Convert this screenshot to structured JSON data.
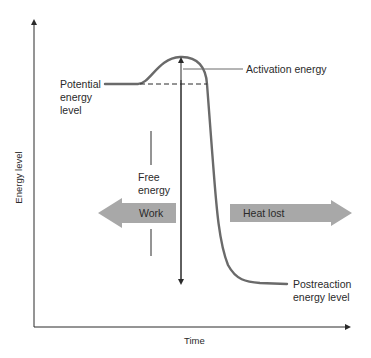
{
  "diagram": {
    "axes": {
      "ylabel": "Energy level",
      "xlabel": "Time"
    },
    "labels": {
      "potential_line1": "Potential",
      "potential_line2": "energy",
      "potential_line3": "level",
      "activation": "Activation energy",
      "free_line1": "Free",
      "free_line2": "energy",
      "work": "Work",
      "heat": "Heat lost",
      "post_line1": "Postreaction",
      "post_line2": "energy level"
    },
    "colors": {
      "curve": "#6a6a6a",
      "arrow_fill": "#a8a8a8",
      "axis": "#2a2a2a"
    }
  }
}
